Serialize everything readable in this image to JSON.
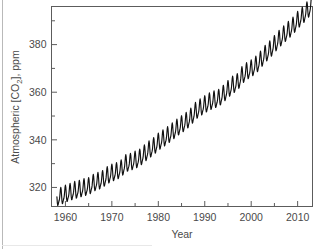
{
  "figure": {
    "background_color": "#ffffff",
    "curve_color": "#111111",
    "axis_color": "#5c5c5c",
    "label_color": "#4a4a4a",
    "border_color": "#b9b9b9"
  },
  "axis_titles": {
    "x": "Year",
    "y_prefix": "Atmospheric [CO",
    "y_subscript": "2",
    "y_suffix": "], ppm",
    "y_full": "Atmospheric [CO2], ppm"
  },
  "ticks": {
    "x_major": [
      "1960",
      "1970",
      "1980",
      "1990",
      "2000",
      "2010"
    ],
    "y_major": [
      "320",
      "340",
      "360",
      "380"
    ]
  },
  "chart_data": {
    "type": "line",
    "title": "",
    "subtitle": "",
    "xlabel": "Year",
    "ylabel": "Atmospheric [CO2], ppm",
    "xlim": [
      1957.0,
      2013.2
    ],
    "ylim": [
      312.0,
      396.0
    ],
    "xticks": [
      1960,
      1970,
      1980,
      1990,
      2000,
      2010
    ],
    "xticks_minor": [
      1965,
      1975,
      1985,
      1995,
      2005
    ],
    "yticks": [
      320,
      340,
      360,
      380
    ],
    "yticks_minor": [
      310,
      330,
      350,
      370,
      390
    ],
    "grid": false,
    "legend": null,
    "annotations": [],
    "series": [
      {
        "name": "Mauna Loa monthly mean CO2",
        "description": "Keeling Curve: monthly atmospheric CO2 concentration with seasonal sawtooth oscillation superimposed on a rising trend.",
        "seasonal_amplitude_ppm": 6.5,
        "x": [
          1958,
          1959,
          1960,
          1961,
          1962,
          1963,
          1964,
          1965,
          1966,
          1967,
          1968,
          1969,
          1970,
          1971,
          1972,
          1973,
          1974,
          1975,
          1976,
          1977,
          1978,
          1979,
          1980,
          1981,
          1982,
          1983,
          1984,
          1985,
          1986,
          1987,
          1988,
          1989,
          1990,
          1991,
          1992,
          1993,
          1994,
          1995,
          1996,
          1997,
          1998,
          1999,
          2000,
          2001,
          2002,
          2003,
          2004,
          2005,
          2006,
          2007,
          2008,
          2009,
          2010,
          2011,
          2012
        ],
        "values": [
          315.3,
          315.9,
          316.9,
          317.6,
          318.4,
          318.9,
          319.6,
          320.0,
          321.4,
          322.2,
          323.0,
          324.6,
          325.7,
          326.3,
          327.5,
          329.7,
          330.2,
          331.1,
          332.0,
          333.8,
          335.4,
          336.8,
          338.7,
          340.1,
          341.4,
          343.0,
          344.6,
          346.0,
          347.4,
          349.2,
          351.6,
          353.1,
          354.4,
          355.6,
          356.4,
          357.1,
          358.8,
          360.8,
          362.6,
          363.7,
          366.6,
          368.3,
          369.5,
          371.0,
          373.1,
          375.6,
          377.4,
          379.7,
          381.9,
          383.7,
          385.6,
          387.4,
          389.8,
          391.6,
          393.8
        ]
      }
    ]
  }
}
